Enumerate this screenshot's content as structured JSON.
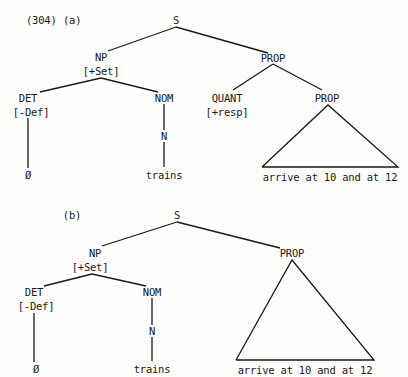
{
  "example_number": "(304)",
  "trees": [
    {
      "id": "a",
      "label": "(a)",
      "nodes": {
        "S": "S",
        "NP": "NP",
        "NP_feature": "[+Set]",
        "PROP_top": "PROP",
        "DET": "DET",
        "DET_feature": "[-Def]",
        "NOM": "NOM",
        "QUANT": "QUANT",
        "QUANT_feature": "[+resp]",
        "PROP_inner": "PROP",
        "N": "N",
        "DET_leaf": "Ø",
        "N_leaf": "trains",
        "PROP_leaf": "arrive at 10 and at 12"
      }
    },
    {
      "id": "b",
      "label": "(b)",
      "nodes": {
        "S": "S",
        "NP": "NP",
        "NP_feature": "[+Set]",
        "PROP": "PROP",
        "DET": "DET",
        "DET_feature": "[-Def]",
        "NOM": "NOM",
        "N": "N",
        "DET_leaf": "Ø",
        "N_leaf": "trains",
        "PROP_leaf": "arrive at 10 and at 12"
      }
    }
  ],
  "colors": {
    "ink": "#1a1a1a",
    "paper": "#fdfdfb"
  }
}
